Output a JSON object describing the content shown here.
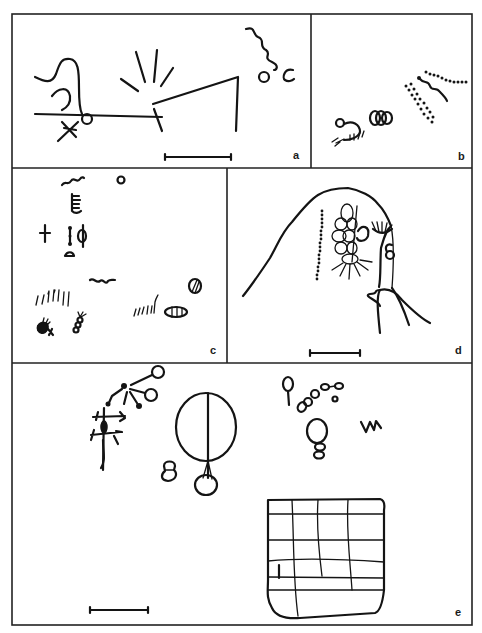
{
  "figure": {
    "ink_color": "#141414",
    "background_color": "#ffffff",
    "panels": [
      {
        "id": "a",
        "label": "a",
        "motifs": [
          "hook-shaped line with spiral",
          "horizontal baseline with circle",
          "asterisk/star mark",
          "radiating rays (sun-burst)",
          "angled line",
          "wavy serpentine line",
          "small circle",
          "c-shaped arc"
        ],
        "has_scale_bar": true
      },
      {
        "id": "b",
        "label": "b",
        "motifs": [
          "anthropomorphic figure with comb",
          "cluster of overlapping circles",
          "dotted lines",
          "wavy line"
        ],
        "has_scale_bar": false
      },
      {
        "id": "c",
        "label": "c",
        "motifs": [
          "wavy line",
          "comb/ladder sign",
          "small circle",
          "cross",
          "dotted staff",
          "phi-like sign",
          "small dome",
          "wavy line",
          "groups of short strokes",
          "filled blob with cross",
          "segmented stick figure",
          "striped oval",
          "divided circle"
        ],
        "has_scale_bar": false
      },
      {
        "id": "d",
        "label": "d",
        "motifs": [
          "rock outline",
          "vertical dotted line",
          "cluster of circles with rays",
          "spiral hook",
          "fan sign",
          "circle with loop"
        ],
        "has_scale_bar": true
      },
      {
        "id": "e",
        "label": "e",
        "motifs": [
          "branching tree-like figure with circles",
          "large divided oval with pendant circle",
          "small stacked figure",
          "circle on stick",
          "chain of small ovals",
          "stacked circles",
          "zigzag mark",
          "grid/net pattern"
        ],
        "has_scale_bar": true
      }
    ]
  }
}
